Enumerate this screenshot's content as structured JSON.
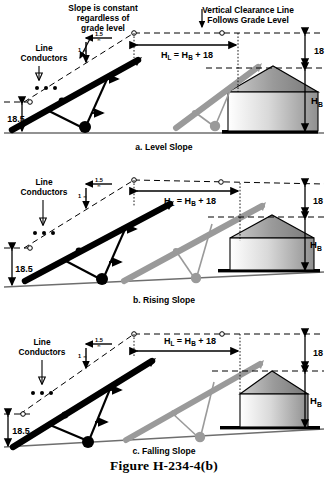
{
  "figure": {
    "caption": "Figure H-234-4(b)",
    "colors": {
      "near_conductor": "#000000",
      "far_conductor": "#8c8c8c",
      "ground": "#6e6e6e",
      "silo_outline": "#000000",
      "dimension": "#000000"
    }
  },
  "panels": [
    {
      "id": "a",
      "caption": "a. Level Slope",
      "ground_type": "level",
      "annotations": {
        "slope_note": [
          "Slope is constant",
          "regardless of",
          "grade level"
        ],
        "line_conductors": [
          "Line",
          "Conductors"
        ],
        "clearance_note": [
          "Vertical Clearance Line",
          "Follows Grade Level"
        ],
        "slope_run": "1.5",
        "slope_run_unit": "m",
        "slope_rise": "1",
        "slope_rise_unit": "m",
        "horizontal_dim": "H",
        "horizontal_dim_sub": "L",
        "horizontal_dim_rest": " = H",
        "horizontal_dim_sub2": "B",
        "horizontal_dim_tail": " + 18",
        "height_18": "18",
        "height_hb": "H",
        "height_hb_sub": "B",
        "height_185": "18.5"
      }
    },
    {
      "id": "b",
      "caption": "b. Rising Slope",
      "ground_type": "rising",
      "annotations": {
        "line_conductors": [
          "Line",
          "Conductors"
        ],
        "slope_run": "1.5",
        "slope_run_unit": "m",
        "slope_rise": "1",
        "slope_rise_unit": "m",
        "horizontal_dim": "H",
        "horizontal_dim_sub": "L",
        "horizontal_dim_rest": " = H",
        "horizontal_dim_sub2": "B",
        "horizontal_dim_tail": " + 18",
        "height_18": "18",
        "height_hb": "H",
        "height_hb_sub": "B",
        "height_185": "18.5"
      }
    },
    {
      "id": "c",
      "caption": "c. Falling Slope",
      "ground_type": "falling",
      "annotations": {
        "line_conductors": [
          "Line",
          "Conductors"
        ],
        "slope_run": "1.5",
        "slope_run_unit": "m",
        "slope_rise": "1",
        "slope_rise_unit": "m",
        "horizontal_dim": "H",
        "horizontal_dim_sub": "L",
        "horizontal_dim_rest": " = H",
        "horizontal_dim_sub2": "B",
        "horizontal_dim_tail": " + 18",
        "height_18": "18",
        "height_hb": "H",
        "height_hb_sub": "B",
        "height_185": "18.5"
      }
    }
  ]
}
